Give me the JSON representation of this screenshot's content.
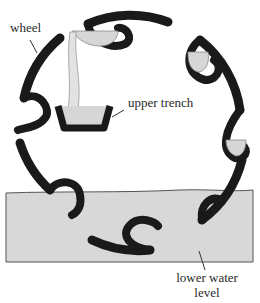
{
  "diagram": {
    "labels": {
      "wheel": "wheel",
      "upper_trench": "upper trench",
      "lower_water_line1": "lower water",
      "lower_water_line2": "level"
    },
    "colors": {
      "ink": "#1a1a1a",
      "water": "#d6d6d6",
      "background": "#ffffff"
    }
  }
}
